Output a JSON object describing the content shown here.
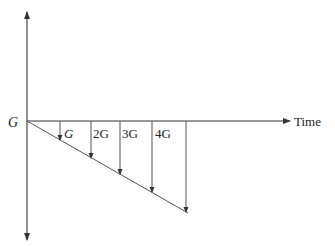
{
  "diagram": {
    "y_axis_label": "G",
    "x_axis_label": "Time",
    "arrow_labels": [
      "G",
      "2G",
      "3G",
      "4G"
    ],
    "colors": {
      "line": "#333333",
      "text": "#222222"
    }
  }
}
